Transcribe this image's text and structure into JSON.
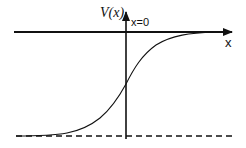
{
  "diagram": {
    "type": "potential-profile-sketch",
    "labels": {
      "y_axis": "V(x)",
      "origin_marker": "x=0",
      "x_axis": "x"
    },
    "elements": {
      "horizontal_axis": {
        "style": "solid",
        "arrow": "right"
      },
      "vertical_axis": {
        "style": "solid",
        "arrow": "up",
        "position": "x=0"
      },
      "asymptote_line": {
        "style": "dashed",
        "position": "bottom"
      },
      "curve": {
        "shape": "sigmoid",
        "from": "lower dashed asymptote at left",
        "to": "horizontal axis at right"
      }
    },
    "colors": {
      "stroke": "#111111",
      "background": "#ffffff"
    }
  }
}
